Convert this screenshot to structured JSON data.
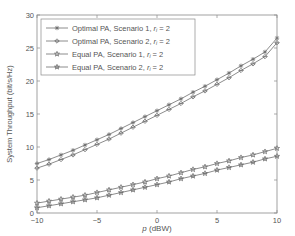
{
  "chart_data": {
    "type": "line",
    "title": "",
    "xlabel": "p (dBW)",
    "ylabel": "System Throughput (bit/s/Hz)",
    "xlim": [
      -10,
      10
    ],
    "ylim": [
      0,
      30
    ],
    "xticks": [
      -10,
      -5,
      0,
      5,
      10
    ],
    "yticks": [
      0,
      5,
      10,
      15,
      20,
      25,
      30
    ],
    "grid": false,
    "legend_position": "upper left",
    "x": [
      -10,
      -9,
      -8,
      -7,
      -6,
      -5,
      -4,
      -3,
      -2,
      -1,
      0,
      1,
      2,
      3,
      4,
      5,
      6,
      7,
      8,
      9,
      10
    ],
    "series": [
      {
        "name": "Optimal PA, Scenario 1, r_i = 2",
        "marker": "asterisk",
        "values": [
          7.5,
          8.1,
          8.8,
          9.5,
          10.3,
          11.1,
          11.9,
          12.8,
          13.7,
          14.6,
          15.5,
          16.4,
          17.3,
          18.3,
          19.2,
          20.2,
          21.2,
          22.3,
          23.3,
          24.4,
          26.5
        ]
      },
      {
        "name": "Optimal PA, Scenario 2, r_i = 2",
        "marker": "diamond",
        "values": [
          6.8,
          7.4,
          8.1,
          8.8,
          9.6,
          10.4,
          11.2,
          12.1,
          13.0,
          13.9,
          14.8,
          15.7,
          16.6,
          17.6,
          18.5,
          19.5,
          20.5,
          21.6,
          22.6,
          23.7,
          25.8
        ]
      },
      {
        "name": "Equal PA, Scenario 1, r_i = 2",
        "marker": "star",
        "values": [
          1.5,
          1.8,
          2.1,
          2.4,
          2.7,
          3.1,
          3.5,
          3.9,
          4.3,
          4.7,
          5.2,
          5.6,
          6.1,
          6.6,
          7.0,
          7.5,
          7.9,
          8.4,
          8.8,
          9.3,
          9.8
        ]
      },
      {
        "name": "Equal PA, Scenario 2, r_i = 2",
        "marker": "hexagram",
        "values": [
          0.8,
          1.1,
          1.4,
          1.7,
          2.0,
          2.3,
          2.7,
          3.1,
          3.5,
          3.9,
          4.3,
          4.7,
          5.2,
          5.6,
          6.0,
          6.5,
          6.9,
          7.3,
          7.7,
          8.2,
          8.6
        ]
      }
    ]
  },
  "legend": {
    "items": [
      {
        "prefix": "Optimal PA, Scenario 1, ",
        "var": "r",
        "sub": "i",
        "suffix": " = 2"
      },
      {
        "prefix": "Optimal PA, Scenario 2, ",
        "var": "r",
        "sub": "i",
        "suffix": " = 2"
      },
      {
        "prefix": "Equal PA, Scenario 1, ",
        "var": "r",
        "sub": "i",
        "suffix": " = 2"
      },
      {
        "prefix": "Equal PA, Scenario 2, ",
        "var": "r",
        "sub": "i",
        "suffix": " = 2"
      }
    ]
  },
  "axes": {
    "xlabel_var": "p",
    "xlabel_unit": " (dBW)",
    "ylabel": "System Throughput (bit/s/Hz)"
  },
  "colors": {
    "line": "#6e6e6e",
    "axis": "#8a8a8a",
    "text": "#555555"
  }
}
